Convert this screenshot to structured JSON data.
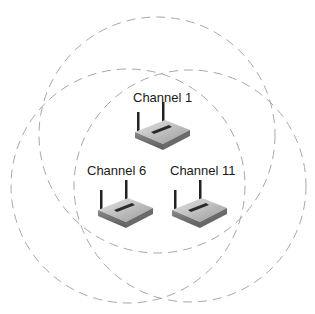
{
  "diagram": {
    "access_points": [
      {
        "label": "Channel 1",
        "channel": 1
      },
      {
        "label": "Channel 6",
        "channel": 6
      },
      {
        "label": "Channel 11",
        "channel": 11
      }
    ],
    "coverage_style": "dashed-circle",
    "colors": {
      "circle": "#a8a8a8",
      "text": "#1a1a1a",
      "router_body": "#9a9a9a",
      "router_dark": "#3a3a3a"
    }
  }
}
